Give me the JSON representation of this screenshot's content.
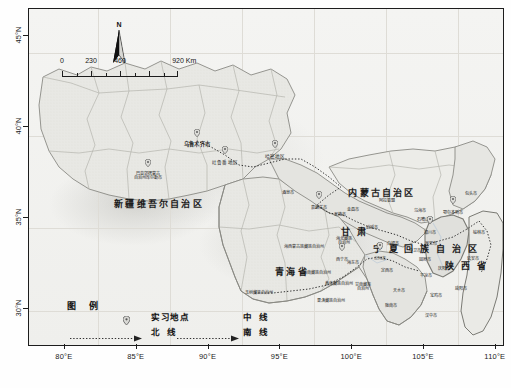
{
  "map": {
    "title_present": false,
    "background_color": "#f2f2f0",
    "frame_color": "#1d1d1d",
    "north_arrow": {
      "letter": "N",
      "name": "north-arrow"
    },
    "scale_bar": {
      "ticks": [
        "0",
        "230",
        "460",
        "920 Km"
      ],
      "unit": "Km"
    },
    "axes": {
      "x_labels": [
        "80°E",
        "85°E",
        "90°E",
        "95°E",
        "100°E",
        "105°E",
        "110°E"
      ],
      "y_labels": [
        "45°N",
        "40°N",
        "35°N",
        "30°N"
      ],
      "x_range": [
        77.5,
        110.5
      ],
      "y_range": [
        28.0,
        46.5
      ]
    },
    "legend": {
      "title": "图 例",
      "site_symbol_label": "实习地点",
      "middle_route_label": "中 线",
      "north_route_label": "北 线",
      "south_route_label": "南 线"
    },
    "provinces": [
      {
        "name": "新疆维吾尔自治区",
        "x": 158,
        "y": 204
      },
      {
        "name": "内蒙古自治区",
        "x": 381,
        "y": 193
      },
      {
        "name": "青海省",
        "x": 291,
        "y": 272
      },
      {
        "name": "甘 肃",
        "x": 354,
        "y": 232
      },
      {
        "name": "陕 西 省",
        "x": 466,
        "y": 266
      },
      {
        "name": "宁 夏 回 族 自 治 区",
        "x": 425,
        "y": 249
      }
    ],
    "prefectures": [
      {
        "name": "乌鲁木齐市",
        "x": 196,
        "y": 144,
        "type": "city"
      },
      {
        "name": "吐鲁番地区",
        "x": 224,
        "y": 162,
        "type": "pref"
      },
      {
        "name": "哈密地区",
        "x": 274,
        "y": 156,
        "type": "pref"
      },
      {
        "name": "巴音郭楞蒙古\n自治州库尔勒市",
        "x": 147,
        "y": 175,
        "type": "tiny"
      },
      {
        "name": "酒泉市",
        "x": 287,
        "y": 192,
        "type": "tiny"
      },
      {
        "name": "嘉峪关市",
        "x": 318,
        "y": 207,
        "type": "tiny"
      },
      {
        "name": "张掖市",
        "x": 339,
        "y": 214,
        "type": "tiny"
      },
      {
        "name": "金昌市",
        "x": 352,
        "y": 209,
        "type": "tiny"
      },
      {
        "name": "海西蒙古族藏族自治州",
        "x": 303,
        "y": 246,
        "type": "tiny"
      },
      {
        "name": "海北藏族\n自治州",
        "x": 343,
        "y": 240,
        "type": "tiny"
      },
      {
        "name": "武威市",
        "x": 371,
        "y": 227,
        "type": "tiny"
      },
      {
        "name": "白银市",
        "x": 392,
        "y": 243,
        "type": "tiny"
      },
      {
        "name": "石嘴山市",
        "x": 424,
        "y": 219,
        "type": "tiny"
      },
      {
        "name": "乌海市",
        "x": 419,
        "y": 210,
        "type": "tiny"
      },
      {
        "name": "鄂尔多斯市",
        "x": 452,
        "y": 212,
        "type": "tiny"
      },
      {
        "name": "银川市",
        "x": 429,
        "y": 232,
        "type": "tiny"
      },
      {
        "name": "吴忠市",
        "x": 430,
        "y": 243,
        "type": "tiny"
      },
      {
        "name": "中卫市",
        "x": 414,
        "y": 250,
        "type": "tiny"
      },
      {
        "name": "固原市",
        "x": 424,
        "y": 259,
        "type": "tiny"
      },
      {
        "name": "西宁市",
        "x": 341,
        "y": 259,
        "type": "tiny"
      },
      {
        "name": "海东市",
        "x": 352,
        "y": 262,
        "type": "tiny"
      },
      {
        "name": "兰州市",
        "x": 379,
        "y": 258,
        "type": "tiny"
      },
      {
        "name": "定西市",
        "x": 386,
        "y": 270,
        "type": "tiny"
      },
      {
        "name": "天水市",
        "x": 398,
        "y": 290,
        "type": "tiny"
      },
      {
        "name": "平凉市",
        "x": 425,
        "y": 275,
        "type": "tiny"
      },
      {
        "name": "庆阳市",
        "x": 443,
        "y": 268,
        "type": "tiny"
      },
      {
        "name": "延安市",
        "x": 472,
        "y": 258,
        "type": "tiny"
      },
      {
        "name": "咸阳市",
        "x": 460,
        "y": 288,
        "type": "tiny"
      },
      {
        "name": "宝鸡市",
        "x": 435,
        "y": 295,
        "type": "tiny"
      },
      {
        "name": "黄南藏族自治州",
        "x": 338,
        "y": 283,
        "type": "tiny"
      },
      {
        "name": "海南藏族自治州",
        "x": 316,
        "y": 272,
        "type": "tiny"
      },
      {
        "name": "果洛藏族自治州",
        "x": 330,
        "y": 300,
        "type": "tiny"
      },
      {
        "name": "玉树藏族自治州",
        "x": 258,
        "y": 292,
        "type": "tiny"
      },
      {
        "name": "甘南藏族\n自治州",
        "x": 362,
        "y": 286,
        "type": "tiny"
      },
      {
        "name": "陇南市",
        "x": 390,
        "y": 305,
        "type": "tiny"
      },
      {
        "name": "汉中市",
        "x": 430,
        "y": 315,
        "type": "tiny"
      },
      {
        "name": "榆林市",
        "x": 478,
        "y": 232,
        "type": "tiny"
      },
      {
        "name": "包头市",
        "x": 470,
        "y": 193,
        "type": "tiny"
      },
      {
        "name": "阿拉善盟",
        "x": 386,
        "y": 200,
        "type": "tiny"
      }
    ],
    "routes": [
      {
        "name": "北线",
        "style": "dotted"
      },
      {
        "name": "中线",
        "style": "dotted"
      },
      {
        "name": "南线",
        "style": "dotted"
      }
    ],
    "sites": [
      {
        "x": 196,
        "y": 140
      },
      {
        "x": 224,
        "y": 157
      },
      {
        "x": 274,
        "y": 151
      },
      {
        "x": 147,
        "y": 170
      },
      {
        "x": 318,
        "y": 202
      },
      {
        "x": 341,
        "y": 254
      },
      {
        "x": 379,
        "y": 253
      },
      {
        "x": 429,
        "y": 227
      },
      {
        "x": 452,
        "y": 207
      }
    ]
  }
}
